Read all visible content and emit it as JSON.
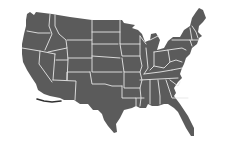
{
  "map": {
    "title": "",
    "region": "contiguous-united-states",
    "style": "choropleth-silhouette",
    "colors": {
      "background": "#ffffff",
      "land": "#5b5b5b",
      "border": "#e6e6e6",
      "coast_mark": "#2f2f2f"
    },
    "labels": [],
    "legend": null
  }
}
